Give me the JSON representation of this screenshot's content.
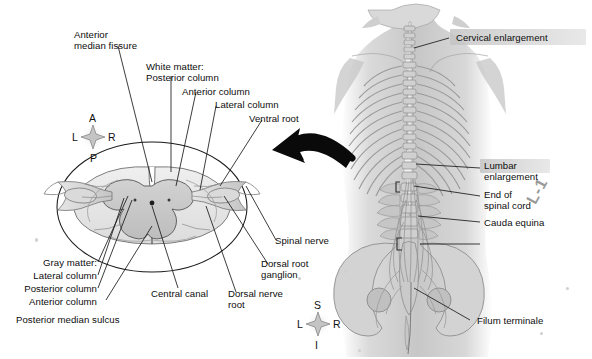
{
  "figure": {
    "background": "#ffffff",
    "ink": "#111111",
    "gray_matter_fill": "#c9c9c9",
    "white_matter_fill": "#e3e3e3",
    "torso_tone": "#b9b9b9"
  },
  "cross_section": {
    "compass": {
      "top": "A",
      "left": "L",
      "right": "R",
      "bottom": "P"
    },
    "labels_top": [
      {
        "id": "anterior-median-fissure",
        "lines": [
          "Anterior",
          "median fissure"
        ]
      },
      {
        "id": "white-matter",
        "lines": [
          "White matter:",
          "Posterior column"
        ]
      },
      {
        "id": "anterior-column",
        "lines": [
          "Anterior column"
        ]
      },
      {
        "id": "lateral-column",
        "lines": [
          "Lateral column"
        ]
      },
      {
        "id": "ventral-root",
        "lines": [
          "Ventral root"
        ]
      }
    ],
    "labels_bottom_left": [
      {
        "id": "gray-matter",
        "lines": [
          "Gray matter:"
        ]
      },
      {
        "id": "gray-lateral-column",
        "lines": [
          "Lateral column"
        ]
      },
      {
        "id": "gray-posterior-column",
        "lines": [
          "Posterior column"
        ]
      },
      {
        "id": "gray-anterior-column",
        "lines": [
          "Anterior column"
        ]
      },
      {
        "id": "posterior-median-sulcus",
        "lines": [
          "Posterior median sulcus"
        ]
      }
    ],
    "labels_bottom_right": [
      {
        "id": "central-canal",
        "lines": [
          "Central canal"
        ]
      },
      {
        "id": "dorsal-nerve-root",
        "lines": [
          "Dorsal nerve",
          "root"
        ]
      },
      {
        "id": "dorsal-root-ganglion",
        "lines": [
          "Dorsal root",
          "ganglion"
        ]
      },
      {
        "id": "spinal-nerve",
        "lines": [
          "Spinal nerve"
        ]
      }
    ]
  },
  "torso": {
    "compass": {
      "top": "S",
      "left": "L",
      "right": "R",
      "bottom": "I"
    },
    "vertebra_marker": "L-1",
    "labels": [
      {
        "id": "cervical-enlargement",
        "lines": [
          "Cervical enlargement"
        ],
        "highlighted": true
      },
      {
        "id": "lumbar-enlargement",
        "lines": [
          "Lumbar",
          "enlargement"
        ],
        "highlighted": true
      },
      {
        "id": "end-of-spinal-cord",
        "lines": [
          "End of",
          "spinal cord"
        ],
        "highlighted": false
      },
      {
        "id": "cauda-equina",
        "lines": [
          "Cauda equina"
        ],
        "highlighted": false
      },
      {
        "id": "filum-terminale",
        "lines": [
          "Filum terminale"
        ],
        "highlighted": false
      }
    ]
  },
  "text": {
    "anterior_median_fissure_1": "Anterior",
    "anterior_median_fissure_2": "median fissure",
    "white_matter_1": "White matter:",
    "white_matter_2": "Posterior column",
    "anterior_column": "Anterior column",
    "lateral_column": "Lateral column",
    "ventral_root": "Ventral root",
    "gray_matter": "Gray matter:",
    "gray_lateral_column": "Lateral column",
    "gray_posterior_column": "Posterior column",
    "gray_anterior_column": "Anterior column",
    "posterior_median_sulcus": "Posterior median sulcus",
    "central_canal": "Central canal",
    "dorsal_nerve_root_1": "Dorsal nerve",
    "dorsal_nerve_root_2": "root",
    "dorsal_root_ganglion_1": "Dorsal root",
    "dorsal_root_ganglion_2": "ganglion",
    "spinal_nerve": "Spinal nerve",
    "cervical_enlargement": "Cervical enlargement",
    "lumbar_enlargement_1": "Lumbar",
    "lumbar_enlargement_2": "enlargement",
    "end_of_spinal_cord_1": "End of",
    "end_of_spinal_cord_2": "spinal cord",
    "cauda_equina": "Cauda equina",
    "filum_terminale": "Filum terminale",
    "compass_a": "A",
    "compass_p": "P",
    "compass_l_left": "L",
    "compass_r_left": "R",
    "compass_s": "S",
    "compass_i": "I",
    "compass_l_right": "L",
    "compass_r_right": "R",
    "l1": "L-1"
  }
}
